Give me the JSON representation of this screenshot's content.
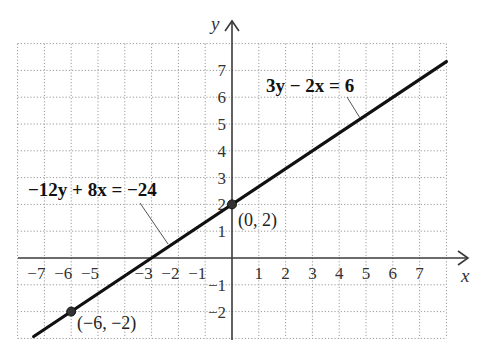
{
  "chart_data": {
    "type": "line",
    "title": "",
    "xlabel": "x",
    "ylabel": "y",
    "xlim": [
      -8,
      8
    ],
    "ylim": [
      -3,
      8
    ],
    "grid": true,
    "x_ticks": [
      "−7",
      "−6",
      "−5",
      "−3",
      "−2",
      "−1",
      "1",
      "2",
      "3",
      "4",
      "5",
      "6",
      "7"
    ],
    "x_tick_values": [
      -7,
      -6,
      -5,
      -3,
      -2,
      -1,
      1,
      2,
      3,
      4,
      5,
      6,
      7
    ],
    "y_ticks": [
      "7",
      "6",
      "5",
      "4",
      "3",
      "2",
      "1",
      "−1",
      "−2"
    ],
    "y_tick_values": [
      7,
      6,
      5,
      4,
      3,
      2,
      1,
      -1,
      -2
    ],
    "series": [
      {
        "name": "3y − 2x = 6",
        "equivalent_name": "−12y + 8x = −24",
        "slope": 0.6667,
        "intercept": 2,
        "x": [
          -7.4,
          8
        ],
        "y": [
          -2.93,
          7.33
        ]
      }
    ],
    "points": [
      {
        "x": 0,
        "y": 2,
        "label": "(0, 2)"
      },
      {
        "x": -6,
        "y": -2,
        "label": "(−6, −2)"
      }
    ],
    "annotations": [
      {
        "text": "3y − 2x = 6",
        "points_to": [
          3.9,
          4.6
        ]
      },
      {
        "text": "−12y + 8x = −24",
        "points_to": [
          -2.4,
          0.4
        ]
      }
    ]
  },
  "labels": {
    "x_axis": "x",
    "y_axis": "y",
    "eq1": "3y − 2x = 6",
    "eq2": "−12y + 8x = −24",
    "pt1": "(0, 2)",
    "pt2": "(−6, −2)"
  }
}
